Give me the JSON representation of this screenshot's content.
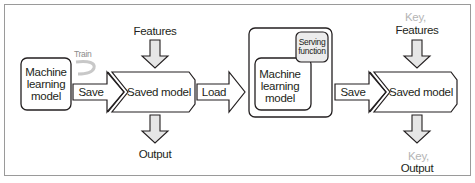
{
  "diagram": {
    "left_stage": {
      "model_box": {
        "line1": "Machine",
        "line2": "learning",
        "line3": "model"
      },
      "train_label": "Train",
      "save_arrow_label": "Save",
      "saved_model_label": "Saved model",
      "features_label": "Features",
      "output_label": "Output"
    },
    "load_arrow_label": "Load",
    "right_stage": {
      "container": {
        "serving_function": {
          "line1": "Serving",
          "line2": "function"
        },
        "model_box": {
          "line1": "Machine",
          "line2": "learning",
          "line3": "model"
        }
      },
      "save_arrow_label": "Save",
      "saved_model_label": "Saved model",
      "features_key": "Key,",
      "features_label": "Features",
      "output_key": "Key,",
      "output_label": "Output"
    },
    "colors": {
      "stroke": "#231f20",
      "arrow_fill": "#e6e6e6",
      "serving_fill": "#ececec",
      "key_text": "#b4b4b4",
      "frame_border": "#9a9a9a"
    }
  }
}
